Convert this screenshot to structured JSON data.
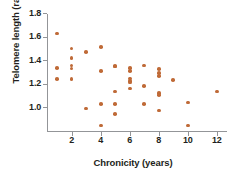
{
  "chart_data": {
    "type": "scatter",
    "title": "",
    "xlabel": "Chronicity (years)",
    "ylabel": "Telomere length (ratio)",
    "xlim": [
      0.3,
      12.7
    ],
    "ylim": [
      0.8,
      1.8
    ],
    "grid": false,
    "legend": null,
    "xticks": [
      2,
      4,
      6,
      8,
      10,
      12
    ],
    "xtick_labels": [
      "2",
      "4",
      "6",
      "8",
      "10",
      "12"
    ],
    "yticks": [
      1.0,
      1.2,
      1.4,
      1.6,
      1.8
    ],
    "ytick_labels": [
      "1.0",
      "1.2",
      "1.4",
      "1.6",
      "1.8"
    ],
    "marker_color": "#bf6a37",
    "axis_color": "#939598",
    "text_color": "#231f20",
    "points": [
      {
        "x": 1,
        "y": 1.625
      },
      {
        "x": 1,
        "y": 1.335
      },
      {
        "x": 1,
        "y": 1.24
      },
      {
        "x": 2,
        "y": 1.5
      },
      {
        "x": 2,
        "y": 1.42
      },
      {
        "x": 2,
        "y": 1.355
      },
      {
        "x": 2,
        "y": 1.33
      },
      {
        "x": 2,
        "y": 1.24
      },
      {
        "x": 3,
        "y": 1.47
      },
      {
        "x": 3,
        "y": 0.99
      },
      {
        "x": 4,
        "y": 1.51
      },
      {
        "x": 4,
        "y": 1.31
      },
      {
        "x": 4,
        "y": 1.03
      },
      {
        "x": 4,
        "y": 0.845
      },
      {
        "x": 5,
        "y": 1.35
      },
      {
        "x": 5,
        "y": 1.345
      },
      {
        "x": 5,
        "y": 1.135
      },
      {
        "x": 5,
        "y": 1.03
      },
      {
        "x": 5,
        "y": 0.945
      },
      {
        "x": 6,
        "y": 1.335
      },
      {
        "x": 6,
        "y": 1.31
      },
      {
        "x": 6,
        "y": 1.245
      },
      {
        "x": 6,
        "y": 1.225
      },
      {
        "x": 6,
        "y": 1.21
      },
      {
        "x": 6,
        "y": 1.16
      },
      {
        "x": 7,
        "y": 1.355
      },
      {
        "x": 7,
        "y": 1.18
      },
      {
        "x": 7,
        "y": 1.03
      },
      {
        "x": 8,
        "y": 1.325
      },
      {
        "x": 8,
        "y": 1.29
      },
      {
        "x": 8,
        "y": 1.265
      },
      {
        "x": 8,
        "y": 1.12
      },
      {
        "x": 8,
        "y": 1.105
      },
      {
        "x": 8,
        "y": 0.975
      },
      {
        "x": 9,
        "y": 1.23
      },
      {
        "x": 10,
        "y": 1.04
      },
      {
        "x": 10,
        "y": 0.845
      },
      {
        "x": 12,
        "y": 1.135
      }
    ]
  }
}
